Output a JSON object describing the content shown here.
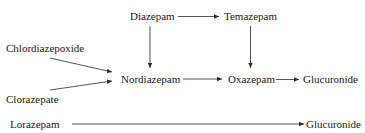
{
  "diagram": {
    "type": "metabolic-pathway",
    "nodes": [
      {
        "id": "diazepam",
        "label": "Diazepam"
      },
      {
        "id": "temazepam",
        "label": "Temazepam"
      },
      {
        "id": "chlordiazepoxide",
        "label": "Chlordiazepoxide"
      },
      {
        "id": "nordiazepam",
        "label": "Nordiazepam"
      },
      {
        "id": "oxazepam",
        "label": "Oxazepam"
      },
      {
        "id": "glucuronide1",
        "label": "Glucuronide"
      },
      {
        "id": "clorazepate",
        "label": "Clorazepate"
      },
      {
        "id": "lorazepam",
        "label": "Lorazepam"
      },
      {
        "id": "glucuronide2",
        "label": "Glucuronide"
      }
    ],
    "edges": [
      {
        "from": "diazepam",
        "to": "temazepam"
      },
      {
        "from": "diazepam",
        "to": "nordiazepam"
      },
      {
        "from": "temazepam",
        "to": "oxazepam"
      },
      {
        "from": "chlordiazepoxide",
        "to": "nordiazepam"
      },
      {
        "from": "clorazepate",
        "to": "nordiazepam"
      },
      {
        "from": "nordiazepam",
        "to": "oxazepam"
      },
      {
        "from": "oxazepam",
        "to": "glucuronide1"
      },
      {
        "from": "lorazepam",
        "to": "glucuronide2"
      }
    ],
    "colors": {
      "text": "#1a1a1a",
      "arrow": "#2a2a2a",
      "background": "#ffffff"
    }
  }
}
